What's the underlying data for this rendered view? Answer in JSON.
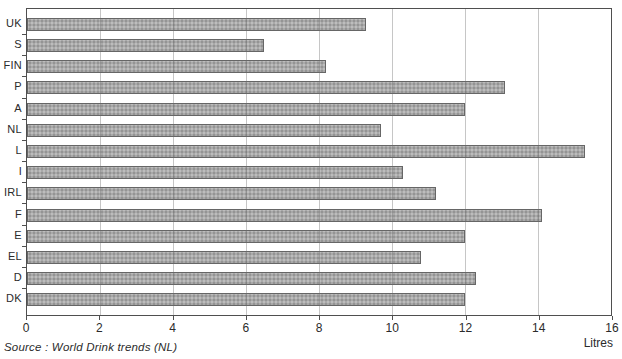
{
  "chart_data": {
    "type": "bar",
    "orientation": "horizontal",
    "title": "",
    "categories": [
      "UK",
      "S",
      "FIN",
      "P",
      "A",
      "NL",
      "L",
      "I",
      "IRL",
      "F",
      "E",
      "EL",
      "D",
      "DK"
    ],
    "values": [
      9.3,
      6.5,
      8.2,
      13.1,
      12.0,
      9.7,
      15.3,
      10.3,
      11.2,
      14.1,
      12.0,
      10.8,
      12.3,
      12.0
    ],
    "xlabel": "Litres",
    "ylabel": "",
    "xlim": [
      0,
      16
    ],
    "xticks": [
      0,
      2,
      4,
      6,
      8,
      10,
      12,
      14,
      16
    ],
    "grid": "vertical-gridlines-at-xticks",
    "legend": "none",
    "source": "Source : World Drink trends (NL)"
  },
  "colors": {
    "background": "#ffffff",
    "bar_fill": "#a9a9a9",
    "bar_border": "#666666",
    "frame": "#4f4f4f",
    "gridline": "#9c9c9c",
    "text": "#2b2b2b"
  }
}
